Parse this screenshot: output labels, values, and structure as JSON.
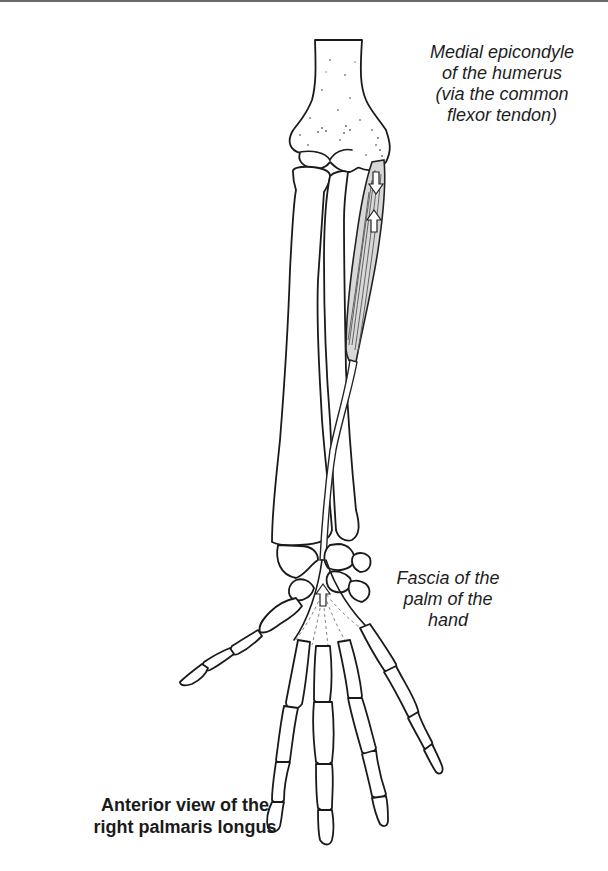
{
  "figure": {
    "title_lines": [
      "Anterior view of the",
      "right palmaris longus"
    ],
    "view": "Anterior view",
    "side": "right",
    "muscle": "palmaris longus"
  },
  "labels": {
    "origin": {
      "lines": [
        "Medial epicondyle",
        "of the humerus",
        "(via the common",
        "flexor tendon)"
      ]
    },
    "insertion": {
      "lines": [
        "Fascia of the",
        "palm of the",
        "hand"
      ]
    }
  },
  "structures": {
    "bones": [
      "humerus",
      "radius",
      "ulna",
      "carpals",
      "metacarpals",
      "phalanges"
    ],
    "arrows": [
      {
        "name": "origin-arrow-down",
        "direction": "down"
      },
      {
        "name": "origin-arrow-up",
        "direction": "up"
      },
      {
        "name": "insertion-arrow-up",
        "direction": "up"
      }
    ]
  },
  "colors": {
    "ink": "#1a1a1a",
    "muscle_fill": "#d8d8d8",
    "background": "#ffffff"
  }
}
